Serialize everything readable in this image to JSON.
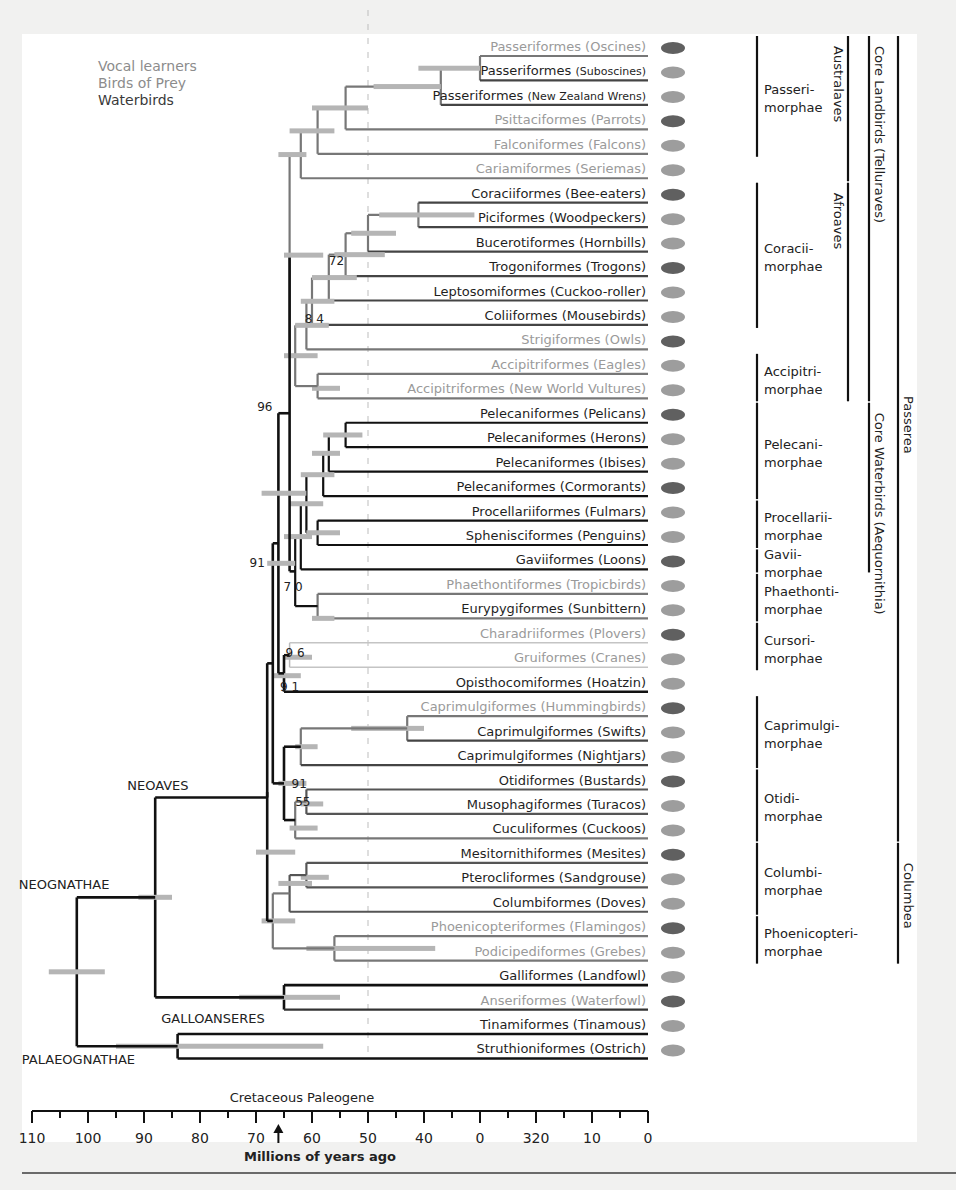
{
  "chart_data": {
    "type": "dendrogram",
    "title": "",
    "xlabel": "Millions of years ago",
    "axis": {
      "range": [
        110,
        0
      ],
      "tick_labels": [
        "110",
        "100",
        "90",
        "80",
        "70",
        "60",
        "50",
        "40",
        "0",
        "320",
        "10",
        "0"
      ],
      "tick_values": [
        110,
        100,
        90,
        80,
        70,
        60,
        50,
        40,
        30,
        20,
        10,
        0
      ],
      "period_label": "Cretaceous Paleogene",
      "boundary_marker_ma": 66,
      "dashed_reference_ma": 50
    },
    "legend": [
      {
        "label": "Vocal learners",
        "color": "#8c8c8c"
      },
      {
        "label": "Birds of Prey",
        "color": "#8c8c8c"
      },
      {
        "label": "Waterbirds",
        "color": "#3a3a3a"
      }
    ],
    "leaves": [
      {
        "order": "Passeriformes",
        "common": "(Oscines)",
        "group": "vocal"
      },
      {
        "order": "Passeriformes",
        "common": "(Suboscines)",
        "group": "plain"
      },
      {
        "order": "Passeriformes",
        "common": "(New Zealand Wrens)",
        "group": "plain"
      },
      {
        "order": "Psittaciformes",
        "common": "(Parrots)",
        "group": "vocal"
      },
      {
        "order": "Falconiformes",
        "common": "(Falcons)",
        "group": "prey"
      },
      {
        "order": "Cariamiformes",
        "common": "(Seriemas)",
        "group": "prey"
      },
      {
        "order": "Coraciiformes",
        "common": "(Bee-eaters)",
        "group": "plain"
      },
      {
        "order": "Piciformes",
        "common": "(Woodpeckers)",
        "group": "plain"
      },
      {
        "order": "Bucerotiformes",
        "common": "(Hornbills)",
        "group": "plain"
      },
      {
        "order": "Trogoniformes",
        "common": "(Trogons)",
        "group": "plain"
      },
      {
        "order": "Leptosomiformes",
        "common": "(Cuckoo-roller)",
        "group": "plain"
      },
      {
        "order": "Coliiformes",
        "common": "(Mousebirds)",
        "group": "plain"
      },
      {
        "order": "Strigiformes",
        "common": "(Owls)",
        "group": "prey"
      },
      {
        "order": "Accipitriformes",
        "common": "(Eagles)",
        "group": "prey"
      },
      {
        "order": "Accipitriformes",
        "common": "(New World Vultures)",
        "group": "prey"
      },
      {
        "order": "Pelecaniformes",
        "common": "(Pelicans)",
        "group": "water"
      },
      {
        "order": "Pelecaniformes",
        "common": "(Herons)",
        "group": "water"
      },
      {
        "order": "Pelecaniformes",
        "common": "(Ibises)",
        "group": "water"
      },
      {
        "order": "Pelecaniformes",
        "common": "(Cormorants)",
        "group": "water"
      },
      {
        "order": "Procellariiformes",
        "common": "(Fulmars)",
        "group": "water"
      },
      {
        "order": "Sphenisciformes",
        "common": "(Penguins)",
        "group": "water"
      },
      {
        "order": "Gaviiformes",
        "common": "(Loons)",
        "group": "water"
      },
      {
        "order": "Phaethontiformes",
        "common": "(Tropicbirds)",
        "group": "prey"
      },
      {
        "order": "Eurypygiformes",
        "common": "(Sunbittern)",
        "group": "water"
      },
      {
        "order": "Charadriiformes",
        "common": "(Plovers)",
        "group": "prey"
      },
      {
        "order": "Gruiformes",
        "common": "(Cranes)",
        "group": "prey"
      },
      {
        "order": "Opisthocomiformes",
        "common": "(Hoatzin)",
        "group": "plain"
      },
      {
        "order": "Caprimulgiformes",
        "common": "(Hummingbirds)",
        "group": "vocal"
      },
      {
        "order": "Caprimulgiformes",
        "common": "(Swifts)",
        "group": "plain"
      },
      {
        "order": "Caprimulgiformes",
        "common": "(Nightjars)",
        "group": "plain"
      },
      {
        "order": "Otidiformes",
        "common": "(Bustards)",
        "group": "plain"
      },
      {
        "order": "Musophagiformes",
        "common": "(Turacos)",
        "group": "plain"
      },
      {
        "order": "Cuculiformes",
        "common": "(Cuckoos)",
        "group": "plain"
      },
      {
        "order": "Mesitornithiformes",
        "common": "(Mesites)",
        "group": "plain"
      },
      {
        "order": "Pterocliformes",
        "common": "(Sandgrouse)",
        "group": "plain"
      },
      {
        "order": "Columbiformes",
        "common": "(Doves)",
        "group": "plain"
      },
      {
        "order": "Phoenicopteriformes",
        "common": "(Flamingos)",
        "group": "prey"
      },
      {
        "order": "Podicipediformes",
        "common": "(Grebes)",
        "group": "prey"
      },
      {
        "order": "Galliformes",
        "common": "(Landfowl)",
        "group": "plain"
      },
      {
        "order": "Anseriformes",
        "common": "(Waterfowl)",
        "group": "prey"
      },
      {
        "order": "Tinamiformes",
        "common": "(Tinamous)",
        "group": "plain"
      },
      {
        "order": "Struthioniformes",
        "common": "(Ostrich)",
        "group": "plain"
      }
    ],
    "clade_labels": [
      {
        "label": "NEOAVES"
      },
      {
        "label": "NEOGNATHAE"
      },
      {
        "label": "GALLOANSERES"
      },
      {
        "label": "PALAEOGNATHAE"
      }
    ],
    "support_values": [
      "72",
      "8 4",
      "96",
      "91",
      "7 0",
      "9 6",
      "9 1",
      "91",
      "55"
    ],
    "morphae_groups": [
      {
        "line1": "Passeri-",
        "line2": "morphae"
      },
      {
        "line1": "Coracii-",
        "line2": "morphae"
      },
      {
        "line1": "Accipitri-",
        "line2": "morphae"
      },
      {
        "line1": "Pelecani-",
        "line2": "morphae"
      },
      {
        "line1": "Procellarii-",
        "line2": "morphae"
      },
      {
        "line1": "Gavii-",
        "line2": "morphae"
      },
      {
        "line1": "Phaethonti-",
        "line2": "morphae"
      },
      {
        "line1": "Cursori-",
        "line2": "morphae"
      },
      {
        "line1": "Caprimulgi-",
        "line2": "morphae"
      },
      {
        "line1": "Otidi-",
        "line2": "morphae"
      },
      {
        "line1": "Columbi-",
        "line2": "morphae"
      },
      {
        "line1": "Phoenicopteri-",
        "line2": "morphae"
      }
    ],
    "super_groups": [
      {
        "label": "Australaves"
      },
      {
        "label": "Afroaves"
      },
      {
        "label": "Core Landbirds (Telluraves)"
      },
      {
        "label": "Core Waterbirds (Aequornithia)"
      },
      {
        "label": "Passerea"
      },
      {
        "label": "Columbea"
      }
    ],
    "colors": {
      "vocal": "#8e8e8e",
      "prey": "#9a9a9a",
      "water": "#262626",
      "plain": "#1c1c1c",
      "branch_grey": "#7a7a7a",
      "ci_bar": "#b5b5b5"
    }
  }
}
